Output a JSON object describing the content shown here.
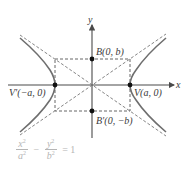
{
  "diagram": {
    "type": "hyperbola",
    "axes": {
      "x_label": "x",
      "y_label": "y"
    },
    "points": {
      "vertex_right": "V(a, 0)",
      "vertex_left": "V′(−a, 0)",
      "covertex_top": "B(0, b)",
      "covertex_bottom": "B′(0, −b)"
    },
    "equation": {
      "x_num": "x",
      "x_den": "a",
      "y_num": "y",
      "y_den": "b",
      "exp": "2",
      "minus": "−",
      "equals": "= 1"
    },
    "colors": {
      "curve": "#6e6e6e",
      "axis": "#4a4a4a",
      "dashed": "#555555",
      "point": "#111111",
      "equation": "#b5b5b5"
    }
  }
}
